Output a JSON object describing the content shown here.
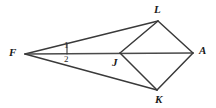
{
  "figure": {
    "background_color": "#ffffff",
    "stroke_color": "#3a3a3a",
    "label_color": "#1a1a1a",
    "width": 216,
    "height": 108,
    "points": {
      "F": {
        "x": 25,
        "y": 54
      },
      "J": {
        "x": 120,
        "y": 53
      },
      "L": {
        "x": 158,
        "y": 21
      },
      "A": {
        "x": 193,
        "y": 53
      },
      "K": {
        "x": 157,
        "y": 90
      }
    },
    "segments": [
      {
        "name": "F-L",
        "from": "F",
        "to": "L"
      },
      {
        "name": "F-A",
        "from": "F",
        "to": "A"
      },
      {
        "name": "F-K",
        "from": "F",
        "to": "K"
      },
      {
        "name": "J-L",
        "from": "J",
        "to": "L"
      },
      {
        "name": "J-K",
        "from": "J",
        "to": "K"
      },
      {
        "name": "L-A",
        "from": "L",
        "to": "A"
      },
      {
        "name": "K-A",
        "from": "K",
        "to": "A"
      }
    ],
    "tick_mark": {
      "x": 67,
      "y_top": 43,
      "y_bottom": 54
    },
    "vertex_labels": [
      {
        "id": "F",
        "text": "F",
        "x": 9,
        "y": 47
      },
      {
        "id": "L",
        "text": "L",
        "x": 154,
        "y": 4
      },
      {
        "id": "J",
        "text": "J",
        "x": 112,
        "y": 57
      },
      {
        "id": "A",
        "text": "A",
        "x": 199,
        "y": 45
      },
      {
        "id": "K",
        "text": "K",
        "x": 155,
        "y": 94
      }
    ],
    "angle_labels": [
      {
        "id": "1",
        "text": "1",
        "x": 64,
        "y": 41
      },
      {
        "id": "2",
        "text": "2",
        "x": 64,
        "y": 55
      }
    ]
  }
}
